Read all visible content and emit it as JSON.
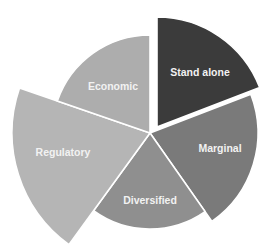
{
  "chart_data": {
    "type": "polar-area",
    "title": "",
    "center": [
      150,
      133
    ],
    "start_angle_deg": 0,
    "direction": "clockwise",
    "slices": [
      {
        "label": "Stand alone",
        "start_deg": 0,
        "end_deg": 69,
        "radius": 110,
        "color": "#3b3b3b",
        "exploded": true,
        "offset": [
          7,
          -6
        ],
        "label_pos": [
          200,
          76
        ]
      },
      {
        "label": "Marginal",
        "start_deg": 69,
        "end_deg": 145,
        "radius": 108,
        "color": "#7a7a7a",
        "exploded": false,
        "offset": [
          0,
          0
        ],
        "label_pos": [
          220,
          152
        ]
      },
      {
        "label": "Diversified",
        "start_deg": 145,
        "end_deg": 216,
        "radius": 96,
        "color": "#8f8f8f",
        "exploded": false,
        "offset": [
          0,
          0
        ],
        "label_pos": [
          150,
          204
        ]
      },
      {
        "label": "Regulatory",
        "start_deg": 216,
        "end_deg": 289,
        "radius": 138,
        "color": "#b5b5b5",
        "exploded": false,
        "offset": [
          0,
          0
        ],
        "label_pos": [
          63,
          156
        ]
      },
      {
        "label": "Economic",
        "start_deg": 289,
        "end_deg": 360,
        "radius": 98,
        "color": "#adadad",
        "exploded": false,
        "offset": [
          0,
          0
        ],
        "label_pos": [
          113,
          90
        ]
      }
    ],
    "categories": [
      "Stand alone",
      "Marginal",
      "Diversified",
      "Regulatory",
      "Economic"
    ],
    "values": [
      110,
      108,
      96,
      138,
      98
    ],
    "legend": "none",
    "grid": false,
    "separator_color": "#ffffff"
  }
}
